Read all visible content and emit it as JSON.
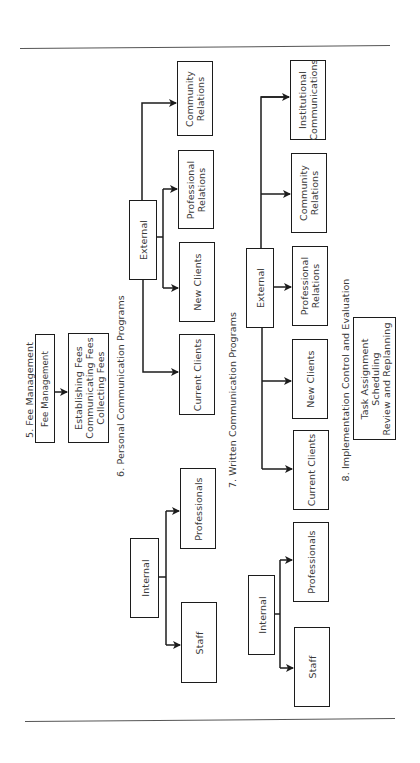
{
  "diagram": {
    "orientation": "rotated -90deg (text reads bottom-to-top)",
    "sections": {
      "fee": {
        "title": "5. Fee Management",
        "parent": "Fee Management",
        "child": [
          "Establishing Fees",
          "Communicating Fees",
          "Collecting Fees"
        ]
      },
      "personal": {
        "title": "6. Personal Communication Programs",
        "internal": {
          "label": "Internal",
          "children": [
            "Staff",
            "Professionals"
          ]
        },
        "external": {
          "label": "External",
          "children": [
            "Current Clients",
            "New Clients",
            "Professional Relations",
            "Community Relations"
          ]
        }
      },
      "written": {
        "title": "7. Written Communication Programs",
        "internal": {
          "label": "Internal",
          "children": [
            "Staff",
            "Professionals"
          ]
        },
        "external": {
          "label": "External",
          "children": [
            "Current Clients",
            "New Clients",
            "Professional Relations",
            "Community Relations",
            "Institutional Communications"
          ]
        }
      },
      "implementation": {
        "title": "8. Implementation Control and Evaluation",
        "items": [
          "Task Assignment",
          "Scheduling",
          "Review and Replanning"
        ]
      }
    },
    "multiline": {
      "personal_prof_rel": [
        "Professional",
        "Relations"
      ],
      "personal_comm_rel": [
        "Community",
        "Relations"
      ],
      "written_prof_rel": [
        "Professional",
        "Relations"
      ],
      "written_comm_rel": [
        "Community",
        "Relations"
      ],
      "written_inst_comm": [
        "Institutional",
        "Communications"
      ]
    },
    "colors": {
      "line": "#1c1c1c",
      "text": "#3a3a3a",
      "rule": "#555555",
      "background": "#ffffff"
    }
  }
}
